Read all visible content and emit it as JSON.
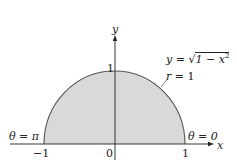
{
  "diagram": {
    "colors": {
      "fill": "#d9d9d9",
      "stroke": "#555555",
      "axis": "#222222",
      "text": "#222222"
    },
    "axes": {
      "x_label": "x",
      "y_label": "y",
      "x_ticks": [
        "−1",
        "0",
        "1"
      ],
      "y_ticks": [
        "1"
      ]
    },
    "curve": {
      "equation": "y = √1 − x²",
      "eq_lhs": "y",
      "eq_eq": " = ",
      "eq_rad": "√",
      "eq_inner": "1 − x",
      "eq_exp": "2",
      "polar": "r = 1",
      "polar_var": "r",
      "polar_rest": " = 1"
    },
    "annotations": {
      "theta_left": "θ = π",
      "theta_right": "θ = 0"
    }
  }
}
